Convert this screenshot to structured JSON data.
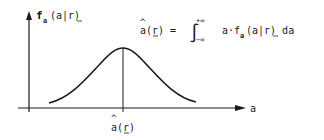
{
  "diagram": {
    "y_axis_label": {
      "f": "f",
      "sub": "a",
      "args": "(a|r)"
    },
    "x_axis_label": "a",
    "estimate_label": {
      "hat": "^",
      "base": "a(r)"
    },
    "equation": {
      "lhs_hat": "^",
      "lhs": "a(r) =",
      "integral": "∫",
      "upper": "+∞",
      "lower": "−∞",
      "integrand_pre": "a·f",
      "integrand_sub": "a",
      "integrand_post": "(a|r) da"
    },
    "curve": "bell-shaped density, peak at estimate"
  },
  "colors": {
    "ink": "#1a1a1a",
    "background": "#ffffff"
  }
}
